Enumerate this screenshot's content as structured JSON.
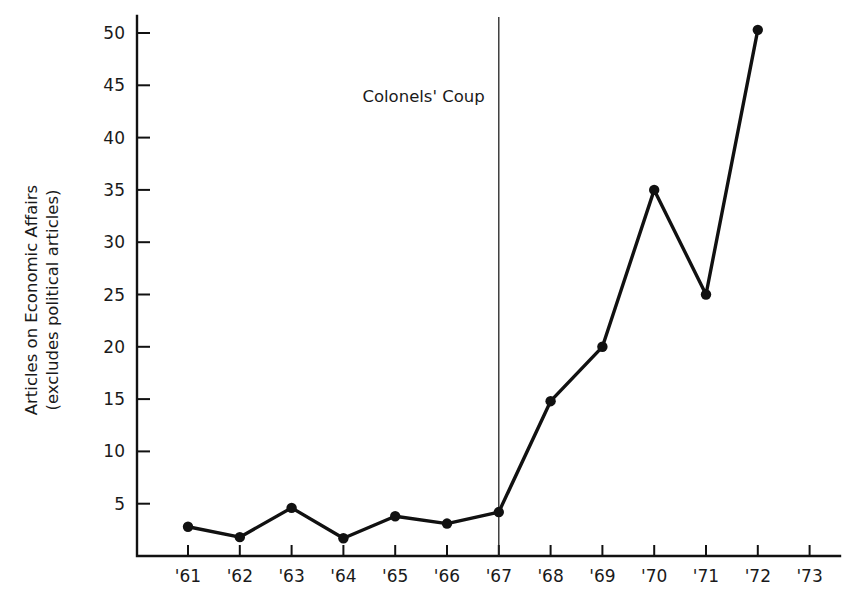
{
  "chart_data": {
    "type": "line",
    "title": "",
    "xlabel": "",
    "ylabel": "Articles on Economic Affairs (excludes political articles)",
    "ylabel_line1": "Articles on Economic Affairs",
    "ylabel_line2": "(excludes political articles)",
    "x": [
      "'61",
      "'62",
      "'63",
      "'64",
      "'65",
      "'66",
      "'67",
      "'68",
      "'69",
      "'70",
      "'71",
      "'72",
      "'73"
    ],
    "categories": [
      "'61",
      "'62",
      "'63",
      "'64",
      "'65",
      "'66",
      "'67",
      "'68",
      "'69",
      "'70",
      "'71",
      "'72",
      "'73"
    ],
    "values": [
      2.8,
      1.8,
      4.6,
      1.7,
      3.8,
      3.1,
      4.2,
      14.8,
      20.0,
      35.0,
      25.0,
      50.3,
      null
    ],
    "series": [
      {
        "name": "Articles on Economic Affairs",
        "values": [
          2.8,
          1.8,
          4.6,
          1.7,
          3.8,
          3.1,
          4.2,
          14.8,
          20.0,
          35.0,
          25.0,
          50.3,
          null
        ]
      }
    ],
    "ylim": [
      0,
      52
    ],
    "yticks": [
      5,
      10,
      15,
      20,
      25,
      30,
      35,
      40,
      45,
      50
    ],
    "ytick_labels": [
      "5",
      "10",
      "15",
      "20",
      "25",
      "30",
      "35",
      "40",
      "45",
      "50"
    ],
    "xtick_labels": [
      "'61",
      "'62",
      "'63",
      "'64",
      "'65",
      "'66",
      "'67",
      "'68",
      "'69",
      "'70",
      "'71",
      "'72",
      "'73"
    ],
    "grid": false,
    "legend": false,
    "legend_position": "none",
    "marker": "filled-circle",
    "line_color": "#111111",
    "marker_color": "#111111",
    "axis_color": "#111111",
    "text_color": "#1a1a1a",
    "background_color": "#ffffff",
    "annotations": [
      {
        "label": "Colonels' Coup",
        "x": "'67",
        "type": "vertical-line-with-label",
        "line_color": "#222222",
        "label_side": "left"
      }
    ]
  },
  "geometry": {
    "width": 868,
    "height": 604,
    "plot_left": 137,
    "plot_bottom": 556,
    "plot_right": 840,
    "plot_top": 16,
    "x_first_tick": 188,
    "x_tick_spacing": 51.8,
    "y_zero": 556,
    "y_per_unit": 10.46,
    "tick_length_y": 13,
    "tick_length_x": 11
  }
}
